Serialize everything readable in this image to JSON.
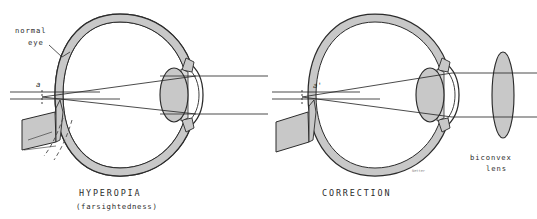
{
  "figure": {
    "title_left": "HYPEROPIA",
    "subtitle_left": "(farsightedness)",
    "title_right": "CORRECTION",
    "background_color": "#ffffff",
    "ink_color": "#2b2b2b",
    "fill_gray": "#c8c8c8",
    "fill_gray_light": "#d9d9d9",
    "signature": "Netter"
  },
  "left_panel": {
    "name": "hyperopia-eye",
    "labels": {
      "normal_eye_line1": "normal",
      "normal_eye_line2": "eye",
      "focal_point": "a"
    },
    "caption": "HYPEROPIA",
    "caption_sub": "(farsightedness)",
    "description": "Elongated-outline hyperopic eye with dashed normal-eye outline; parallel light rays converge at point a behind the retina"
  },
  "right_panel": {
    "name": "correction-eye",
    "labels": {
      "focal_point": "a'",
      "lens_line1": "biconvex",
      "lens_line2": "lens"
    },
    "caption": "CORRECTION",
    "description": "Same eye with an external biconvex corrective lens bending parallel rays so they converge at a' on the retina"
  }
}
